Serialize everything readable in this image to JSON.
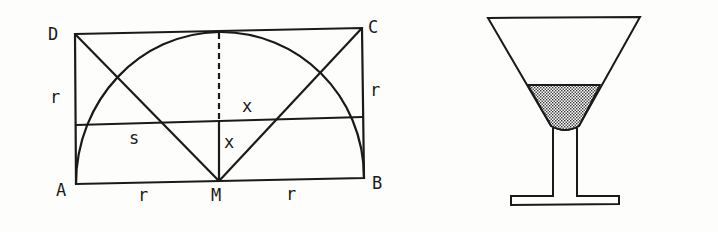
{
  "figure_left": {
    "description": "Rectangle ABCD with semicircle on AB centered at M, diagonals from D and C to M, and a horizontal chord",
    "vertices": {
      "A": "A",
      "B": "B",
      "C": "C",
      "D": "D",
      "M": "M"
    },
    "labels": {
      "side_left": "r",
      "side_right": "r",
      "base_left": "r",
      "base_right": "r",
      "segment_s": "s",
      "upper_x": "x",
      "lower_x": "x"
    }
  },
  "figure_right": {
    "description": "Conical cocktail glass partially filled with liquid (stippled)"
  },
  "colors": {
    "ink": "#1a1a1a",
    "background": "#fdfdfb"
  }
}
